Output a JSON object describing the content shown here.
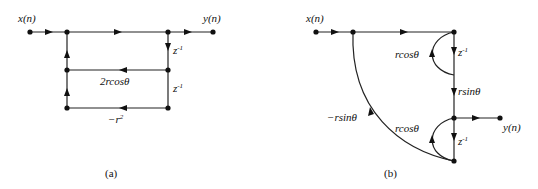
{
  "diagram_a": {
    "caption": "(a)",
    "input_label": "x(n)",
    "output_label": "y(n)",
    "z_inv_1": "z",
    "z_inv_1_sup": "-1",
    "z_inv_2": "z",
    "z_inv_2_sup": "-1",
    "gain_feedback_1": "2rcosθ",
    "gain_feedback_2": "−r",
    "gain_feedback_2_sup": "2"
  },
  "diagram_b": {
    "caption": "(b)",
    "input_label": "x(n)",
    "output_label": "y(n)",
    "z_inv_1": "z",
    "z_inv_1_sup": "-1",
    "z_inv_2": "z",
    "z_inv_2_sup": "-1",
    "gain_loop_top": "rcosθ",
    "gain_loop_bottom": "rcosθ",
    "gain_forward": "rsinθ",
    "gain_feedback": "−rsinθ"
  }
}
